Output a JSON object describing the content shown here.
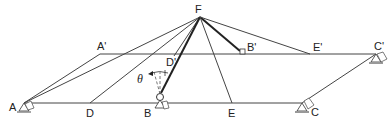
{
  "diagram": {
    "type": "structural-geometry",
    "colors": {
      "line": "#333333",
      "heavy_line": "#222222",
      "background": "#ffffff",
      "support_fill": "#999999"
    },
    "points": {
      "F": {
        "label": "F",
        "x": 200,
        "y": 17
      },
      "A": {
        "label": "A",
        "x": 24,
        "y": 103
      },
      "D": {
        "label": "D",
        "x": 90,
        "y": 103
      },
      "B": {
        "label": "B",
        "x": 160,
        "y": 97
      },
      "E": {
        "label": "E",
        "x": 232,
        "y": 103
      },
      "C": {
        "label": "C",
        "x": 302,
        "y": 103
      },
      "A_prime": {
        "label": "A'",
        "x": 100,
        "y": 54
      },
      "D_prime": {
        "label": "D'",
        "x": 176,
        "y": 54
      },
      "B_prime": {
        "label": "B'",
        "x": 240,
        "y": 52
      },
      "E_prime": {
        "label": "E'",
        "x": 310,
        "y": 54
      },
      "C_prime": {
        "label": "C'",
        "x": 376,
        "y": 54
      }
    },
    "angle_label": "θ",
    "labels": {
      "F": "F",
      "A": "A",
      "D": "D",
      "B": "B",
      "E": "E",
      "C": "C",
      "A_prime": "A'",
      "D_prime": "D'",
      "B_prime": "B'",
      "E_prime": "E'",
      "C_prime": "C'",
      "theta": "θ"
    },
    "members": [
      {
        "from": "A",
        "to": "C"
      },
      {
        "from": "A_prime",
        "to": "C_prime"
      },
      {
        "from": "A",
        "to": "A_prime"
      },
      {
        "from": "C",
        "to": "C_prime"
      },
      {
        "from": "F",
        "to": "A"
      },
      {
        "from": "F",
        "to": "D"
      },
      {
        "from": "F",
        "to": "B",
        "heavy": true
      },
      {
        "from": "F",
        "to": "D_prime"
      },
      {
        "from": "F",
        "to": "B_prime",
        "heavy": true
      },
      {
        "from": "F",
        "to": "E"
      },
      {
        "from": "F",
        "to": "E_prime"
      }
    ],
    "supports": [
      "A",
      "B",
      "C",
      "C_prime"
    ]
  }
}
